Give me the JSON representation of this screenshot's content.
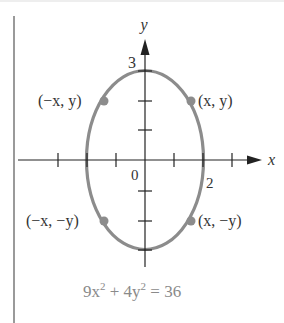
{
  "diagram": {
    "equation": {
      "a": "9x",
      "a_exp": "2",
      "plus": " + 4y",
      "b_exp": "2",
      "rhs": " = 36",
      "full": "9x² + 4y² = 36"
    },
    "axes": {
      "x_label": "x",
      "y_label": "y",
      "origin_label": "0"
    },
    "intercepts": {
      "y_top_label": "3",
      "x_right_label": "2"
    },
    "points": [
      {
        "label": "(x, y)",
        "position": "upper-right"
      },
      {
        "label": "(−x, y)",
        "position": "upper-left"
      },
      {
        "label": "(−x, −y)",
        "position": "lower-left"
      },
      {
        "label": "(x, −y)",
        "position": "lower-right"
      }
    ],
    "colors": {
      "ellipse": "#8c8c8c",
      "axes": "#222222",
      "point": "#8c8c8c",
      "equation": "#8a8a8a"
    }
  }
}
